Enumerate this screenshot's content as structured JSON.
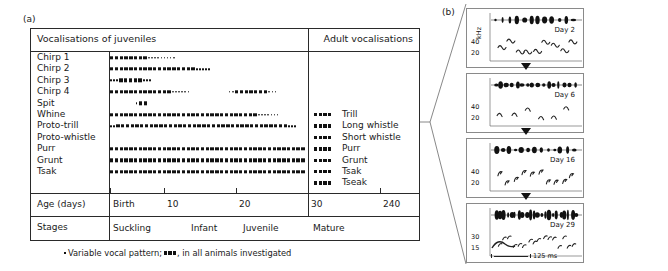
{
  "figure": {
    "panel_a_letter": "(a)",
    "panel_b_letter": "(b)",
    "footnote_prefix": "Variable vocal pattern;",
    "footnote_suffix": ", in all animals investigated"
  },
  "panel_a": {
    "header_left": "Vocalisations of juveniles",
    "header_right": "Adult vocalisations",
    "age_label": "Age (days)",
    "stages_label": "Stages",
    "age_ticks": [
      "Birth",
      "10",
      "20",
      "30",
      "240"
    ],
    "stages": [
      "Suckling",
      "Infant",
      "Juvenile",
      "Mature"
    ],
    "rows": [
      {
        "label": "Chirp 1",
        "adult": ""
      },
      {
        "label": "Chirp 2",
        "adult": ""
      },
      {
        "label": "Chirp 3",
        "adult": ""
      },
      {
        "label": "Chirp 4",
        "adult": ""
      },
      {
        "label": "Spit",
        "adult": ""
      },
      {
        "label": "Whine",
        "adult": "Trill"
      },
      {
        "label": "Proto-trill",
        "adult": "Long whistle"
      },
      {
        "label": "Proto-whistle",
        "adult": "Short whistle"
      },
      {
        "label": "Purr",
        "adult": "Purr"
      },
      {
        "label": "Grunt",
        "adult": "Grunt"
      },
      {
        "label": "Tsak",
        "adult": "Tsak"
      },
      {
        "label": "",
        "adult": "Tseak"
      }
    ]
  },
  "chart_data": {
    "type": "timeline",
    "xlabel": "Age (days)",
    "x_tick_labels": [
      "Birth",
      "10",
      "20",
      "30",
      "240"
    ],
    "x_tick_positions_pct": [
      0,
      18,
      42,
      66,
      90
    ],
    "stages": [
      "Suckling",
      "Infant",
      "Juvenile",
      "Mature"
    ],
    "legend": {
      "solid_square": "in all animals investigated",
      "small_dot": "variable vocal pattern"
    },
    "series": [
      {
        "name": "Chirp 1",
        "segments": [
          {
            "start_pct": 0,
            "solid_pct": 19,
            "dotted_pct": 23
          }
        ],
        "adult": null
      },
      {
        "name": "Chirp 2",
        "segments": [
          {
            "start_pct": 0,
            "solid_pct": 44,
            "dotted_pct": 13
          }
        ],
        "adult": null
      },
      {
        "name": "Chirp 3",
        "segments": [
          {
            "start_pct": 0,
            "solid_pct": 0,
            "dotted_pct": 8,
            "mid_solid_pct": 12,
            "tail_dotted_pct": 8
          }
        ],
        "adult": null
      },
      {
        "name": "Chirp 4",
        "segments": [
          {
            "start_pct": 0,
            "solid_pct": 32,
            "dotted_pct": 14
          },
          {
            "start_pct": 60,
            "solid_pct": 0,
            "dotted_pct": 5,
            "mid_solid_pct": 17,
            "tail_dotted_pct": 8
          }
        ],
        "adult": null
      },
      {
        "name": "Spit",
        "segments": [
          {
            "start_pct": 13,
            "solid_pct": 6,
            "dotted_pct": 0,
            "lead_dot": true
          }
        ],
        "adult": null
      },
      {
        "name": "Whine",
        "segments": [
          {
            "start_pct": 0,
            "solid_pct": 76,
            "dotted_pct": 17
          }
        ],
        "adult": "Trill"
      },
      {
        "name": "Proto-trill",
        "segments": [
          {
            "start_pct": 0,
            "solid_pct": 0,
            "dotted_pct": 6,
            "mid_solid_pct": 87,
            "tail_dotted_pct": 7
          }
        ],
        "adult": "Long whistle"
      },
      {
        "name": "Proto-whistle",
        "segments": [],
        "adult": "Short whistle"
      },
      {
        "name": "Purr",
        "segments": [
          {
            "start_pct": 0,
            "solid_pct": 100,
            "dotted_pct": 0
          }
        ],
        "adult": "Purr"
      },
      {
        "name": "Grunt",
        "segments": [
          {
            "start_pct": 0,
            "solid_pct": 100,
            "dotted_pct": 0
          }
        ],
        "adult": "Grunt"
      },
      {
        "name": "Tsak",
        "segments": [
          {
            "start_pct": 0,
            "solid_pct": 100,
            "dotted_pct": 0
          }
        ],
        "adult": "Tsak"
      },
      {
        "name": "",
        "segments": [],
        "adult": "Tseak"
      }
    ]
  },
  "panel_b": {
    "y_axis_unit": "kHz",
    "scale_bar": "125 ms",
    "spectrograms": [
      {
        "day": "Day 2",
        "y_ticks": [
          "40",
          "20"
        ]
      },
      {
        "day": "Day 6",
        "y_ticks": [
          "40",
          "20"
        ]
      },
      {
        "day": "Day 16",
        "y_ticks": [
          "40",
          "20"
        ]
      },
      {
        "day": "Day 29",
        "y_ticks": [
          "30",
          "15"
        ]
      }
    ]
  }
}
